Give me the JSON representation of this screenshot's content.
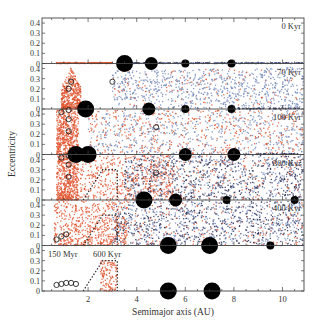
{
  "chart_data": {
    "type": "scatter",
    "title": "",
    "xlabel": "Semimajor axis (AU)",
    "ylabel": "Eccentricity",
    "xlim": [
      0.1,
      10.9
    ],
    "ylim_per_panel": [
      0,
      0.45
    ],
    "x_ticks": [
      2,
      4,
      6,
      8,
      10
    ],
    "y_ticks": [
      0,
      0.1,
      0.2,
      0.3,
      0.4
    ],
    "y_tick_labels": [
      "0",
      "0.1",
      "0.2",
      "0.3",
      "0.4"
    ],
    "grid": false,
    "legend": null,
    "series_colors": {
      "inner_planetesimals": "#e0502a",
      "outer_planetesimals": "#6f84b8",
      "dark_planetesimals": "#1f2650",
      "giant_planets": "#000000",
      "embryos": "#000000"
    },
    "panels": [
      {
        "label": "0 Kyr",
        "planets": [
          {
            "a": 3.5,
            "e": 0,
            "size": "large"
          },
          {
            "a": 4.6,
            "e": 0,
            "size": "medium"
          },
          {
            "a": 6.0,
            "e": 0,
            "size": "small"
          },
          {
            "a": 7.9,
            "e": 0,
            "size": "small"
          }
        ],
        "embryos": [],
        "disk_description": "Planetesimals on circular orbits: red from ~0.7 to 3 AU, blue/dark from 3.6 to ~10.9 AU"
      },
      {
        "label": "70 Kyr",
        "planets": [
          {
            "a": 1.9,
            "e": 0,
            "size": "large"
          },
          {
            "a": 4.5,
            "e": 0,
            "size": "medium"
          },
          {
            "a": 6.0,
            "e": 0,
            "size": "small"
          },
          {
            "a": 7.9,
            "e": 0,
            "size": "small"
          }
        ],
        "embryos": [
          {
            "a": 1.3,
            "e": 0.25
          },
          {
            "a": 1.2,
            "e": 0.18
          },
          {
            "a": 3.0,
            "e": 0.25
          }
        ],
        "disk_description": "Red excited inner disk up to e~0.4 near 1-1.5 AU; blue scattered from 3-9 AU"
      },
      {
        "label": "100 Kyr",
        "planets": [
          {
            "a": 1.5,
            "e": 0,
            "size": "large"
          },
          {
            "a": 2.0,
            "e": 0,
            "size": "large"
          },
          {
            "a": 6.0,
            "e": 0,
            "size": "medium"
          },
          {
            "a": 8.0,
            "e": 0,
            "size": "medium"
          }
        ],
        "embryos": [
          {
            "a": 0.9,
            "e": 0.4
          },
          {
            "a": 1.2,
            "e": 0.42
          },
          {
            "a": 1.2,
            "e": 0.33
          },
          {
            "a": 1.2,
            "e": 0.21
          },
          {
            "a": 4.8,
            "e": 0.25
          }
        ],
        "disk_description": "Mixed red and blue scattered disk"
      },
      {
        "label": "300 Kyr",
        "planets": [
          {
            "a": 4.3,
            "e": 0,
            "size": "large"
          },
          {
            "a": 5.6,
            "e": 0,
            "size": "medium"
          },
          {
            "a": 7.7,
            "e": 0,
            "size": "small"
          },
          {
            "a": 10.5,
            "e": 0,
            "size": "small"
          }
        ],
        "embryos": [
          {
            "a": 0.9,
            "e": 0.4
          },
          {
            "a": 1.2,
            "e": 0.42
          },
          {
            "a": 1.2,
            "e": 0.33
          },
          {
            "a": 1.2,
            "e": 0.21
          },
          {
            "a": 4.8,
            "e": 0.25
          }
        ],
        "region_outline": {
          "points": [
            [
              1.8,
              0
            ],
            [
              2.6,
              0.3
            ],
            [
              3.2,
              0.3
            ],
            [
              3.2,
              0
            ]
          ],
          "style": "dotted"
        },
        "disk_description": "Red inner scattered, dark blue outer disk"
      },
      {
        "label": "400 Kyr",
        "planets": [
          {
            "a": 5.3,
            "e": 0,
            "size": "large"
          },
          {
            "a": 7.0,
            "e": 0,
            "size": "large"
          },
          {
            "a": 9.5,
            "e": 0,
            "size": "small"
          }
        ],
        "embryos": [
          {
            "a": 0.7,
            "e": 0.04
          },
          {
            "a": 0.9,
            "e": 0.07
          },
          {
            "a": 1.1,
            "e": 0.09
          }
        ],
        "region_outline": {
          "points": [
            [
              1.8,
              0
            ],
            [
              2.6,
              0.3
            ],
            [
              3.2,
              0.3
            ],
            [
              3.2,
              0
            ]
          ],
          "style": "dotted"
        },
        "disk_description": "Red concentration near 1 AU, blue scattered disk beyond 3 AU"
      },
      {
        "label_left": "150 Myr",
        "label_right": "600 Kyr",
        "planets": [
          {
            "a": 5.3,
            "e": 0,
            "size": "large"
          },
          {
            "a": 7.1,
            "e": 0,
            "size": "large"
          }
        ],
        "embryos": [
          {
            "a": 0.7,
            "e": 0.04
          },
          {
            "a": 0.9,
            "e": 0.05
          },
          {
            "a": 1.1,
            "e": 0.06
          },
          {
            "a": 1.3,
            "e": 0.06
          },
          {
            "a": 1.5,
            "e": 0.05
          }
        ],
        "region_outline": {
          "points": [
            [
              1.8,
              0
            ],
            [
              2.6,
              0.3
            ],
            [
              3.2,
              0.3
            ],
            [
              3.2,
              0
            ]
          ],
          "style": "dotted"
        },
        "disk_description": "Remaining red planetesimals in asteroid belt region 2.5-3.2 AU, e<0.3"
      }
    ]
  }
}
